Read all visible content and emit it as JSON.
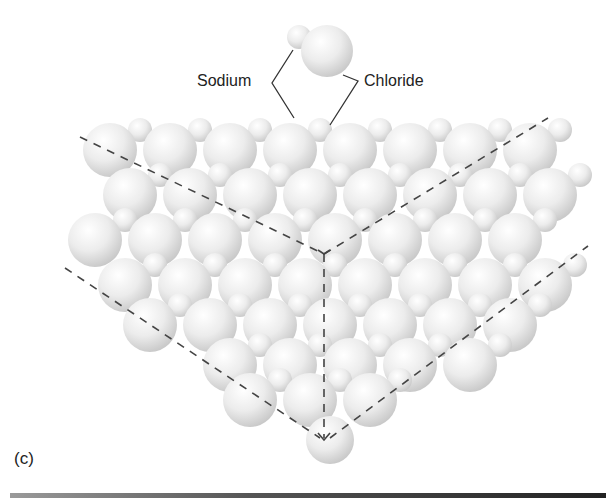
{
  "figure": {
    "panel_label": "(c)",
    "labels": {
      "sodium": "Sodium",
      "chloride": "Chloride"
    },
    "colors": {
      "sphere_fill": "#e8e8e8",
      "dash_line": "#444444",
      "text": "#222222"
    }
  }
}
